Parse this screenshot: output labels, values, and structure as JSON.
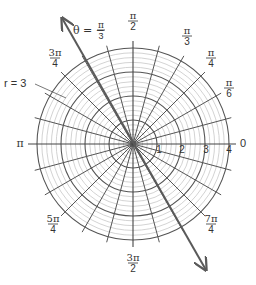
{
  "diagram": {
    "type": "polar-grid",
    "center": [
      133,
      144
    ],
    "unit_px": 24,
    "rings": [
      1,
      2,
      3,
      4
    ],
    "minor_ring_step": 0.2,
    "spoke_step_deg": 15,
    "colors": {
      "major_line": "#555555",
      "minor_line": "#c8c8c8",
      "arrow": "#5a5a5a",
      "text": "#333333"
    },
    "radius_labels": [
      "1",
      "2",
      "3",
      "4"
    ],
    "angle_labels": [
      {
        "id": "zero",
        "num": "0",
        "den": "",
        "deg": 0
      },
      {
        "id": "pi-6",
        "num": "π",
        "den": "6",
        "deg": 30
      },
      {
        "id": "pi-4",
        "num": "π",
        "den": "4",
        "deg": 45
      },
      {
        "id": "pi-3",
        "num": "π",
        "den": "3",
        "deg": 60
      },
      {
        "id": "pi-2",
        "num": "π",
        "den": "2",
        "deg": 90
      },
      {
        "id": "3pi-4",
        "num": "3π",
        "den": "4",
        "deg": 135
      },
      {
        "id": "pi",
        "num": "π",
        "den": "",
        "deg": 180
      },
      {
        "id": "5pi-4",
        "num": "5π",
        "den": "4",
        "deg": 225
      },
      {
        "id": "3pi-2",
        "num": "3π",
        "den": "2",
        "deg": 270
      },
      {
        "id": "7pi-4",
        "num": "7π",
        "den": "4",
        "deg": 315
      }
    ],
    "annotations": {
      "theta_line": {
        "prefix": "θ = −",
        "num": "π",
        "den": "3"
      },
      "r_circle": "r = 3"
    }
  }
}
